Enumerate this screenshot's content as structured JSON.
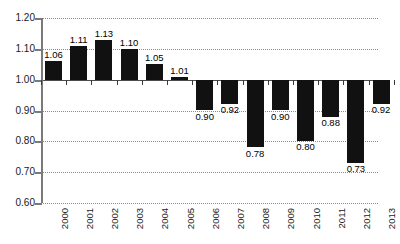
{
  "chart_data": {
    "type": "bar",
    "title": "",
    "subtitle": "",
    "xlabel": "",
    "ylabel": "",
    "categories": [
      "2000",
      "2001",
      "2002",
      "2003",
      "2004",
      "2005",
      "2006",
      "2007",
      "2008",
      "2009",
      "2010",
      "2011",
      "2012",
      "2013"
    ],
    "values": [
      1.06,
      1.11,
      1.13,
      1.1,
      1.05,
      1.01,
      0.9,
      0.92,
      0.78,
      0.9,
      0.8,
      0.88,
      0.73,
      0.92
    ],
    "value_labels": [
      "1.06",
      "1.11",
      "1.13",
      "1.10",
      "1.05",
      "1.01",
      "0.90",
      "0.92",
      "0.78",
      "0.90",
      "0.80",
      "0.88",
      "0.73",
      "0.92"
    ],
    "baseline": 1.0,
    "ylim": [
      0.6,
      1.2
    ],
    "ytick_step": 0.1,
    "ytick_labels": [
      "1.20",
      "1.10",
      "1.00",
      "0.90",
      "0.80",
      "0.70",
      "0.60"
    ],
    "ytick_values": [
      1.2,
      1.1,
      1.0,
      0.9,
      0.8,
      0.7,
      0.6
    ],
    "grid": true,
    "legend": "none",
    "bar_color": "#111111",
    "grid_color": "#8a8a8a",
    "axis_color": "#7a7a7a",
    "baseline_color": "#4d4d4d",
    "label_color": "#000000",
    "background": "#ffffff"
  }
}
